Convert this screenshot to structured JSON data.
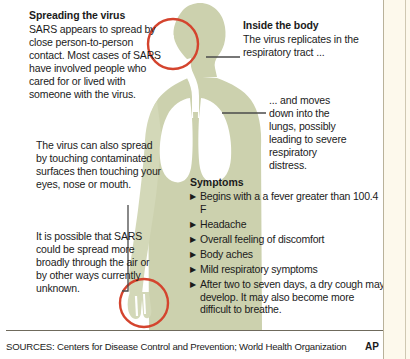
{
  "graphic": {
    "body_fill": "#ccd1ae",
    "body_fill_light": "#d7dbbd",
    "airway_fill": "#ffffff",
    "highlight_circle_color": "#d4442e",
    "leader_line_color": "#4a4a4a",
    "background": "#ffffff",
    "margin_background": "#fdf9ec",
    "rule_color": "#6f6a5c"
  },
  "spreading": {
    "heading": "Spreading the virus",
    "body": "SARS appears to spread by close person-to-person contact. Most cases of SARS have involved people who cared for or lived with someone with the virus."
  },
  "touching": {
    "body": "The virus can also spread by touching contaminated surfaces then touching your eyes, nose or mouth."
  },
  "airborne": {
    "body": "It is possible that SARS could be spread more broadly through the air or by other ways currently unknown."
  },
  "inside": {
    "heading": "Inside the body",
    "body": "The virus replicates in the respiratory tract ..."
  },
  "lungs": {
    "body": "... and moves down into the lungs, possibly leading to severe respiratory distress."
  },
  "symptoms": {
    "heading": "Symptoms",
    "bullet_marker": "▶",
    "items": [
      "Begins with a a fever greater than 100.4 F",
      "Headache",
      "Overall feeling of discomfort",
      "Body aches",
      "Mild respiratory symptoms",
      "After two to seven days, a dry cough may develop. It may also become more difficult to breathe."
    ]
  },
  "footer": {
    "sources": "SOURCES: Centers for Disease Control and Prevention; World Health Organization",
    "credit": "AP"
  }
}
